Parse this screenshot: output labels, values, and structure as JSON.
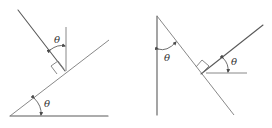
{
  "figure": {
    "left_diagram": {
      "description": "Incline at angle theta with perpendicular and vertical lines",
      "angle_labels": [
        "θ",
        "θ"
      ],
      "has_right_angle_marker": true
    },
    "right_diagram": {
      "description": "Vertical line with slanted line and perpendicular, horizontal reference",
      "angle_labels": [
        "θ",
        "θ"
      ],
      "has_right_angle_marker": true
    },
    "colors": {
      "line": "#5a5a5a",
      "label": "#333333",
      "background": "#ffffff"
    }
  }
}
